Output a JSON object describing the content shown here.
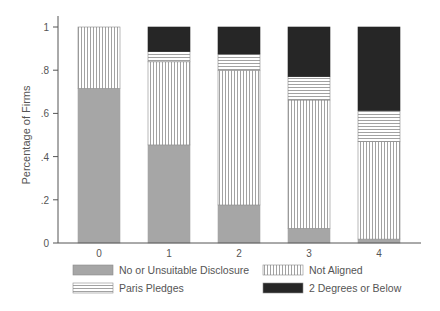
{
  "chart_data": {
    "type": "bar",
    "stacked": true,
    "title": "",
    "xlabel": "",
    "ylabel": "Percentage of Firms",
    "ylim": [
      0,
      1
    ],
    "yticks": [
      0,
      0.2,
      0.4,
      0.6,
      0.8,
      1
    ],
    "ytick_labels": [
      "0",
      ".2",
      ".4",
      ".6",
      ".8",
      "1"
    ],
    "categories": [
      "0",
      "1",
      "2",
      "3",
      "4"
    ],
    "grid": false,
    "legend_position": "bottom",
    "series": [
      {
        "name": "No or Unsuitable Disclosure",
        "pattern": "solid-gray",
        "color": "#a6a6a6",
        "values": [
          0.716,
          0.454,
          0.176,
          0.068,
          0.018
        ]
      },
      {
        "name": "Not Aligned",
        "pattern": "vertical-lines",
        "color": "#ffffff",
        "values": [
          0.284,
          0.385,
          0.624,
          0.594,
          0.451
        ]
      },
      {
        "name": "Paris Pledges",
        "pattern": "horizontal-lines",
        "color": "#ffffff",
        "values": [
          0.0,
          0.047,
          0.075,
          0.108,
          0.144
        ]
      },
      {
        "name": "2 Degrees or Below",
        "pattern": "solid-dark",
        "color": "#262626",
        "values": [
          0.0,
          0.114,
          0.125,
          0.23,
          0.387
        ]
      }
    ],
    "legend_order": [
      0,
      1,
      2,
      3
    ]
  }
}
